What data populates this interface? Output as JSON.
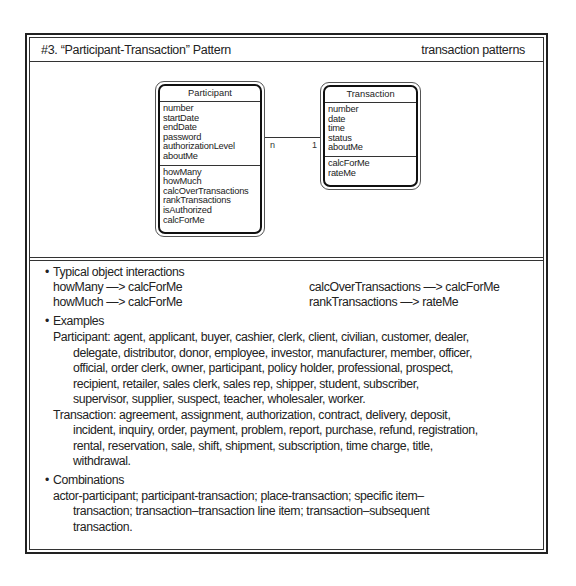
{
  "header": {
    "title": "#3. “Participant-Transaction” Pattern",
    "category": "transaction patterns"
  },
  "diagram": {
    "classes": [
      {
        "name": "Participant",
        "attributes": [
          "number",
          "startDate",
          "endDate",
          "password",
          "authorizationLevel",
          "aboutMe"
        ],
        "services": [
          "howMany",
          "howMuch",
          "calcOverTransactions",
          "rankTransactions",
          "isAuthorized",
          "calcForMe"
        ]
      },
      {
        "name": "Transaction",
        "attributes": [
          "number",
          "date",
          "time",
          "status",
          "aboutMe"
        ],
        "services": [
          "calcForMe",
          "rateMe"
        ]
      }
    ],
    "association": {
      "from": "Participant",
      "to": "Transaction",
      "multiplicity_from": "n",
      "multiplicity_to": "1"
    }
  },
  "interactions": {
    "heading": "Typical object interactions",
    "left": [
      "howMany —> calcForMe",
      "howMuch —> calcForMe"
    ],
    "right": [
      "calcOverTransactions —> calcForMe",
      "rankTransactions —> rateMe"
    ]
  },
  "examples": {
    "heading": "Examples",
    "participant_lines": [
      "Participant: agent, applicant, buyer, cashier, clerk, client, civilian, customer, dealer,",
      "delegate, distributor, donor, employee, investor, manufacturer, member, officer,",
      "official, order clerk, owner, participant, policy holder, professional, prospect,",
      "recipient, retailer, sales clerk, sales rep, shipper, student, subscriber,",
      "supervisor, supplier, suspect, teacher, wholesaler, worker."
    ],
    "transaction_lines": [
      "Transaction: agreement, assignment, authorization, contract, delivery, deposit,",
      "incident, inquiry, order, payment, problem, report, purchase, refund, registration,",
      "rental, reservation, sale, shift, shipment, subscription, time charge, title,",
      "withdrawal."
    ]
  },
  "combinations": {
    "heading": "Combinations",
    "lines": [
      "actor-participant; participant-transaction; place-transaction; specific item–",
      "transaction; transaction–transaction line item; transaction–subsequent",
      "transaction."
    ]
  }
}
